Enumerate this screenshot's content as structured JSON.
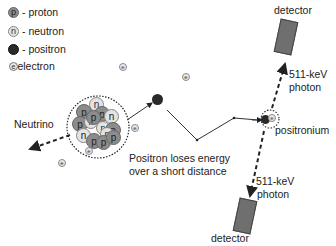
{
  "legend": {
    "items": [
      {
        "symbol": "p",
        "label": "- proton",
        "type": "proton"
      },
      {
        "symbol": "n",
        "label": "- neutron",
        "type": "neutron"
      },
      {
        "symbol": "",
        "label": "- positron",
        "type": "positron"
      },
      {
        "symbol": "e",
        "label": "- electron",
        "type": "electron"
      }
    ]
  },
  "labels": {
    "neutrino": "Neutrino",
    "positron_travel_line1": "Positron loses energy",
    "positron_travel_line2": "over a short distance",
    "positronium": "positronium",
    "photon_top_line1": "511-keV",
    "photon_top_line2": "photon",
    "photon_bottom_line1": "511-keV",
    "photon_bottom_line2": "photon",
    "detector_top": "detector",
    "detector_bottom": "detector"
  },
  "nucleus": {
    "particles": [
      "n",
      "p",
      "p",
      "n",
      "p",
      "n",
      "p",
      "n",
      "n",
      "p",
      "n",
      "p",
      "p",
      "p"
    ]
  },
  "electron_symbol": "e",
  "colors": {
    "proton": "#8c8c8c",
    "neutron": "#e3e3e3",
    "positron": "#2a2a2a",
    "electron": "#ececec",
    "detector": "#6f6f6f"
  }
}
